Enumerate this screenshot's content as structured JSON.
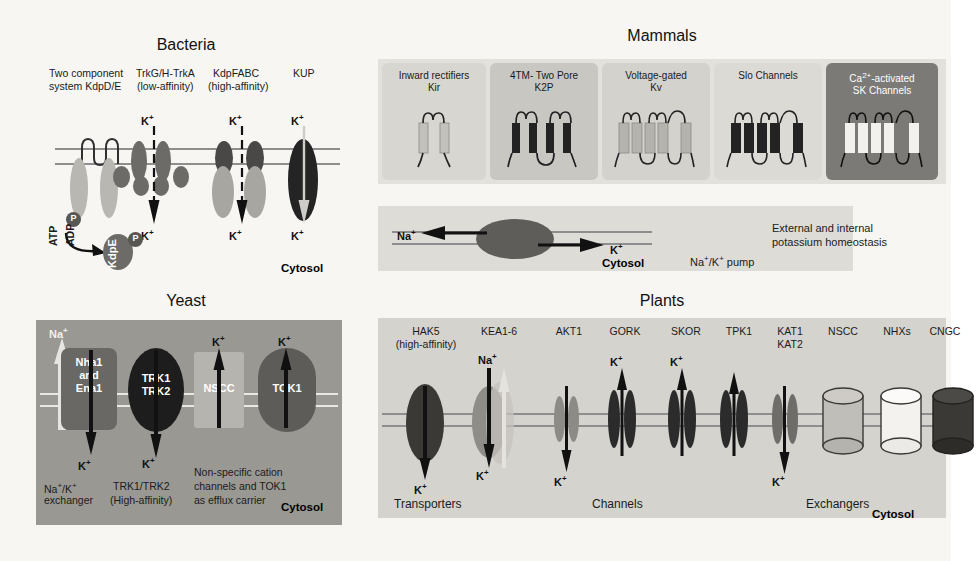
{
  "figure": {
    "panels": [
      "Bacteria",
      "Mammals",
      "Yeast",
      "Plants"
    ]
  },
  "bacteria": {
    "title": "Bacteria",
    "labels": {
      "two_component_l1": "Two component",
      "two_component_l2": "system KdpD/E",
      "trk_l1": "TrkG/H-TrkA",
      "trk_l2": "(low-affinity)",
      "kdp_l1": "KdpFABC",
      "kdp_l2": "(high-affinity)",
      "kup": "KUP"
    },
    "ions": {
      "k_top_1": "K+",
      "k_top_2": "K+",
      "k_top_3": "K+",
      "k_bot_1": "K+",
      "k_bot_2": "K+",
      "k_bot_3": "K+"
    },
    "energetics": {
      "atp": "ATP",
      "adp": "ADP",
      "kdpe": "KdpE",
      "p1": "P",
      "p2": "P"
    },
    "cytosol": "Cytosol"
  },
  "mammals": {
    "title": "Mammals",
    "channels": [
      {
        "name": "inward-rectifiers",
        "line1": "Inward rectifiers",
        "line2": "Kir",
        "fill": "#d8d6d1",
        "text": "#1b1b1b"
      },
      {
        "name": "two-pore",
        "line1": "4TM- Two Pore",
        "line2": "K2P",
        "fill": "#c9c7c2",
        "text": "#1b1b1b"
      },
      {
        "name": "voltage-gated",
        "line1": "Voltage-gated",
        "line2": "Kv",
        "fill": "#d4d2cd",
        "text": "#1b1b1b"
      },
      {
        "name": "slo-channels",
        "line1": "Slo Channels",
        "line2": "",
        "fill": "#dcdad5",
        "text": "#1b1b1b"
      },
      {
        "name": "sk-channels",
        "line1": "Ca2+-activated",
        "line2": "SK Channels",
        "fill": "#7c7a76",
        "text": "#ffffff"
      }
    ],
    "pump": {
      "na": "Na+",
      "k": "K+",
      "cytosol": "Cytosol",
      "label": "Na+/K+ pump"
    },
    "homeostasis_l1": "External and internal",
    "homeostasis_l2": "potassium homeostasis"
  },
  "yeast": {
    "title": "Yeast",
    "na_top": "Na+",
    "proteins": [
      {
        "name": "nha1-ena1",
        "lines": [
          "Nha1",
          "and",
          "Ena1"
        ]
      },
      {
        "name": "trk1-trk2",
        "lines": [
          "TRK1",
          "TRK2"
        ]
      },
      {
        "name": "nscc",
        "lines": [
          "NSCC"
        ]
      },
      {
        "name": "tok1",
        "lines": [
          "TOK1"
        ]
      }
    ],
    "ions": {
      "k_nscc": "K+",
      "k_tok1": "K+",
      "k_bot_1": "K+",
      "k_bot_2": "K+"
    },
    "captions": {
      "exchanger_l1": "Na+/K+",
      "exchanger_l2": "exchanger",
      "trk_l1": "TRK1/TRK2",
      "trk_l2": "(High-affinity)",
      "nscc_l1": "Non-specific cation",
      "nscc_l2": "channels and TOK1",
      "nscc_l3": "as efflux carrier"
    },
    "cytosol": "Cytosol"
  },
  "plants": {
    "title": "Plants",
    "headers": [
      {
        "name": "hak5",
        "line1": "HAK5",
        "line2": "(high-affinity)"
      },
      {
        "name": "kea1-6",
        "line1": "KEA1-6",
        "line2": ""
      },
      {
        "name": "akt1",
        "line1": "AKT1",
        "line2": ""
      },
      {
        "name": "gork",
        "line1": "GORK",
        "line2": ""
      },
      {
        "name": "skor",
        "line1": "SKOR",
        "line2": ""
      },
      {
        "name": "tpk1",
        "line1": "TPK1",
        "line2": ""
      },
      {
        "name": "kat1-kat2",
        "line1": "KAT1",
        "line2": "KAT2"
      },
      {
        "name": "nscc",
        "line1": "NSCC",
        "line2": ""
      },
      {
        "name": "nhxs",
        "line1": "NHXs",
        "line2": ""
      },
      {
        "name": "cngc",
        "line1": "CNGC",
        "line2": ""
      }
    ],
    "ions": {
      "na_kea": "Na+",
      "k_gork": "K+",
      "k_skor": "K+",
      "k_hak5": "K+",
      "k_kea": "K+",
      "k_akt1": "K+",
      "k_kat": "K+"
    },
    "groups": {
      "transporters": "Transporters",
      "channels": "Channels",
      "exchangers": "Exchangers"
    },
    "cytosol": "Cytosol"
  },
  "colors": {
    "panel_bg_mammal": "#dbd9d4",
    "panel_bg_yeast": "#9a9893",
    "panel_bg_plants": "#d5d3ce",
    "membrane": "#8e8e8e",
    "dark_protein": "#2a2a2a",
    "mid_protein": "#6d6b67",
    "light_protein": "#b9b7b2"
  }
}
